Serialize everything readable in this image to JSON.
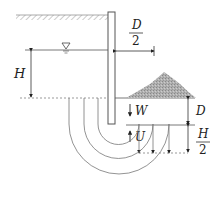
{
  "diagram": {
    "labels": {
      "H": "H",
      "D_half_num": "D",
      "D_half_den": "2",
      "W": "W",
      "U": "U",
      "D": "D",
      "H_half_num": "H",
      "H_half_den": "2"
    },
    "symbols": {
      "water_table": "water-level-triangle",
      "downward_arrow": "arrow-down",
      "upward_arrow": "arrow-up"
    },
    "colors": {
      "line": "#555555",
      "dashed": "#888888",
      "berm_fill": "#aaaaaa",
      "ground_hatch": "#999999"
    }
  }
}
